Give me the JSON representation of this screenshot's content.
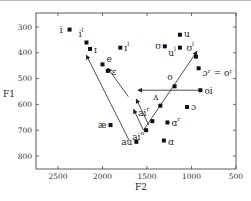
{
  "chart_data": {
    "type": "scatter",
    "title": "",
    "xlabel": "F2",
    "ylabel": "F1",
    "xlim": [
      2750,
      500
    ],
    "ylim": [
      850,
      250
    ],
    "x_inverted": true,
    "y_inverted": true,
    "x_ticks": [
      2500,
      2000,
      1500,
      1000,
      500
    ],
    "y_ticks": [
      300,
      400,
      500,
      600,
      700,
      800
    ],
    "grid": false,
    "legend": null,
    "points": [
      {
        "label": "i",
        "sup": "",
        "x": 2370,
        "y": 310
      },
      {
        "label": "i",
        "sup": "l",
        "x": 2180,
        "y": 360
      },
      {
        "label": "ɪ",
        "sup": "",
        "x": 2140,
        "y": 385
      },
      {
        "label": "ɪ",
        "sup": "l",
        "x": 1800,
        "y": 380
      },
      {
        "label": "e",
        "sup": "",
        "x": 2000,
        "y": 445
      },
      {
        "label": "ɛ",
        "sup": "",
        "x": 1940,
        "y": 470
      },
      {
        "label": "u",
        "sup": "",
        "x": 1130,
        "y": 330
      },
      {
        "label": "ʊ",
        "sup": "",
        "x": 1300,
        "y": 375
      },
      {
        "label": "u",
        "sup": "l",
        "x": 1130,
        "y": 380
      },
      {
        "label": "ʊ",
        "sup": "l",
        "x": 950,
        "y": 415
      },
      {
        "label": "ɔ",
        "sup": "r",
        "x": 920,
        "y": 460,
        "annotation": "ɔʳ = oʳ"
      },
      {
        "label": "o",
        "sup": "",
        "x": 1190,
        "y": 530
      },
      {
        "label": "oi",
        "sup": "",
        "x": 900,
        "y": 545
      },
      {
        "label": "æ",
        "sup": "",
        "x": 1910,
        "y": 680
      },
      {
        "label": "ʌ",
        "sup": "",
        "x": 1350,
        "y": 605
      },
      {
        "label": "ɔ",
        "sup": "",
        "x": 1050,
        "y": 610
      },
      {
        "label": "ai",
        "sup": "r",
        "x": 1440,
        "y": 665
      },
      {
        "label": "ɑ",
        "sup": "r",
        "x": 1270,
        "y": 670
      },
      {
        "label": "ai",
        "sup": "o",
        "x": 1510,
        "y": 700
      },
      {
        "label": "au",
        "sup": "",
        "x": 1620,
        "y": 745
      },
      {
        "label": "ɑ",
        "sup": "",
        "x": 1310,
        "y": 740
      }
    ],
    "arrows": [
      {
        "from": [
          1700,
          740
        ],
        "to": [
          2180,
          410
        ],
        "note": "long diagonal line toward i/ɪ"
      },
      {
        "from": [
          1710,
          570
        ],
        "to": [
          1940,
          460
        ],
        "note": "arrow toward ɛ"
      },
      {
        "from": [
          1540,
          700
        ],
        "to": [
          1650,
          620
        ],
        "note": "short arrow from aiº"
      },
      {
        "from": [
          1540,
          700
        ],
        "to": [
          940,
          395
        ],
        "note": "diphthong arrow toward ʊˡ"
      },
      {
        "from": [
          900,
          545
        ],
        "to": [
          1600,
          545
        ],
        "note": "oi leftward arrow"
      },
      {
        "from": [
          1480,
          680
        ],
        "to": [
          1620,
          580
        ],
        "note": "arrow from aiʳ"
      }
    ],
    "annotations": [
      "ɔʳ = oʳ"
    ]
  },
  "axes": {
    "x_title": "F2",
    "y_title": "F1",
    "x_tick_labels": [
      "2500",
      "2000",
      "1500",
      "1000",
      "500"
    ],
    "y_tick_labels": [
      "300",
      "400",
      "500",
      "600",
      "700",
      "800"
    ]
  }
}
